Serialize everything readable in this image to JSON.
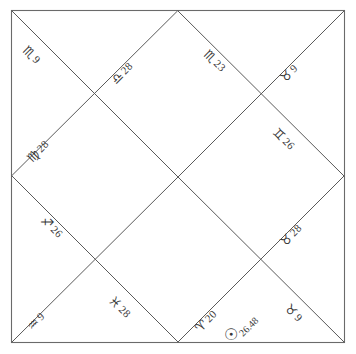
{
  "chart": {
    "style": "north-indian-diamond",
    "border_color": "#6a6a6a",
    "line_color": "#5a5a5a",
    "background": "#ffffff",
    "ink_color": "#3a3a3a"
  },
  "houses": [
    {
      "position": "top-left-outer",
      "sign_name": "scorpio",
      "sign_glyph": "♏",
      "degree": "9"
    },
    {
      "position": "top-center-left",
      "sign_name": "libra",
      "sign_glyph": "♎",
      "degree": "28"
    },
    {
      "position": "top-center-right",
      "sign_name": "scorpio",
      "sign_glyph": "♏",
      "degree": "23"
    },
    {
      "position": "top-right-outer",
      "sign_name": "taurus",
      "sign_glyph": "♉",
      "degree": "9"
    },
    {
      "position": "left-middle",
      "sign_name": "virgo",
      "sign_glyph": "♍",
      "degree": "28"
    },
    {
      "position": "right-middle",
      "sign_name": "gemini",
      "sign_glyph": "♊",
      "degree": "26"
    },
    {
      "position": "left-lower",
      "sign_name": "sagittarius",
      "sign_glyph": "♐",
      "degree": "26"
    },
    {
      "position": "right-lower",
      "sign_name": "taurus",
      "sign_glyph": "♉",
      "degree": "28"
    },
    {
      "position": "bottom-left-outer",
      "sign_name": "aquarius",
      "sign_glyph": "♒",
      "degree": "9"
    },
    {
      "position": "bottom-center-left",
      "sign_name": "pisces",
      "sign_glyph": "♓",
      "degree": "28"
    },
    {
      "position": "bottom-center-right",
      "sign_name": "aries",
      "sign_glyph": "♈",
      "degree": "20"
    },
    {
      "position": "bottom-right-outer",
      "sign_name": "taurus",
      "sign_glyph": "♉",
      "degree": "9"
    }
  ],
  "planets": [
    {
      "position": "bottom-center",
      "planet_name": "sun",
      "planet_glyph": "☉",
      "degree": "26.48"
    }
  ]
}
